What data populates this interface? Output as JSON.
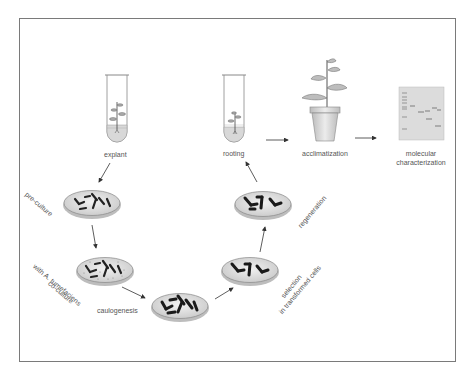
{
  "diagram": {
    "colors": {
      "frame": "#7a7a7a",
      "text": "#555555",
      "arrow": "#333333",
      "dish_fill": "#e2e2e2",
      "dish_rim": "#888888",
      "explant_pieces": "#222222",
      "gel_bg": "#dcdcdc",
      "plant_leaf": "#bdbdbd",
      "pot": "#d4d4d4"
    },
    "steps": [
      {
        "id": "explant",
        "label": "explant",
        "icon": "test-tube-plantlet-icon"
      },
      {
        "id": "pre-culture",
        "label": "pre-culture",
        "icon": "petri-dish-icon"
      },
      {
        "id": "co-culture",
        "label_line1": "co-culture",
        "label_line2": "with A. tumefaciens",
        "icon": "petri-dish-bacteria-icon"
      },
      {
        "id": "caulogenesis",
        "label": "caulogenesis",
        "icon": "petri-dish-dense-icon"
      },
      {
        "id": "selection",
        "label_line1": "selection",
        "label_line2": "in transformed cells",
        "icon": "petri-dish-sparse-icon"
      },
      {
        "id": "regeneration",
        "label": "regeneration",
        "icon": "petri-dish-shoots-icon"
      },
      {
        "id": "rooting",
        "label": "rooting",
        "icon": "test-tube-rooted-plantlet-icon"
      },
      {
        "id": "acclimatization",
        "label": "acclimatization",
        "icon": "potted-plant-icon"
      },
      {
        "id": "molecular",
        "label_line1": "molecular",
        "label_line2": "characterization",
        "icon": "gel-electrophoresis-icon"
      }
    ],
    "flow": [
      "explant",
      "pre-culture",
      "co-culture",
      "caulogenesis",
      "selection",
      "regeneration",
      "rooting",
      "acclimatization",
      "molecular"
    ]
  }
}
